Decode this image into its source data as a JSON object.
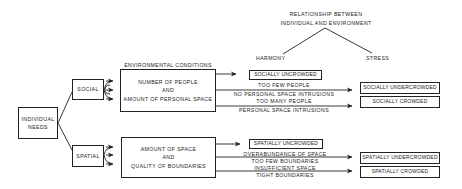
{
  "relationship": {
    "title_line1": "RELATIONSHIP BETWEEN",
    "title_line2": "INDIVIDUAL AND ENVIRONMENT",
    "harmony": "HARMONY",
    "stress": "STRESS"
  },
  "root": {
    "line1": "INDIVIDUAL",
    "line2": "NEEDS"
  },
  "environmental_conditions_label": "ENVIRONMENTAL CONDITIONS",
  "social": {
    "label": "SOCIAL",
    "conditions": {
      "line1": "NUMBER OF PEOPLE",
      "line2": "AND",
      "line3": "AMOUNT OF PERSONAL SPACE"
    },
    "harmony_outcome": "SOCIALLY UNCROWDED",
    "under": {
      "line1": "TOO FEW PEOPLE",
      "line2": "NO PERSONAL SPACE INTRUSIONS",
      "outcome": "SOCIALLY UNDERCROWDED"
    },
    "over": {
      "line1": "TOO MANY PEOPLE",
      "line2": "PERSONAL SPACE INTRUSIONS",
      "outcome": "SOCIALLY CROWDED"
    }
  },
  "spatial": {
    "label": "SPATIAL",
    "conditions": {
      "line1": "AMOUNT OF SPACE",
      "line2": "AND",
      "line3": "QUALITY OF BOUNDARIES"
    },
    "harmony_outcome": "SPATIALLY UNCROWDED",
    "under": {
      "line1": "OVERABUNDANCE OF SPACE",
      "line2": "TOO FEW BOUNDARIES",
      "outcome": "SPATIALLY UNDERCROWDED"
    },
    "over": {
      "line1": "INSUFFICIENT SPACE",
      "line2": "TIGHT BOUNDARIES",
      "outcome": "SPATIALLY CROWDED"
    }
  }
}
